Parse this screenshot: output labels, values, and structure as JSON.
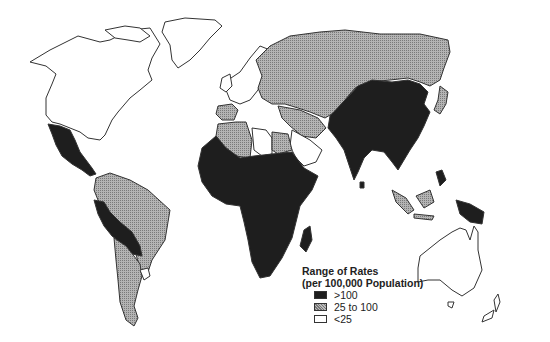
{
  "map": {
    "type": "choropleth world map",
    "colors": {
      "high": "#1e1e1e",
      "mid": "#a6a6a6",
      "low": "#ffffff",
      "outline": "#333333"
    }
  },
  "legend": {
    "title_line1": "Range of Rates",
    "title_line2": "(per 100,000 Population)",
    "items": [
      {
        "label": ">100",
        "class": "high"
      },
      {
        "label": "25 to 100",
        "class": "mid"
      },
      {
        "label": "<25",
        "class": "low"
      }
    ]
  },
  "regions": {
    "high": [
      "Mexico",
      "Central America",
      "Peru",
      "Bolivia",
      "Sub-Saharan Africa",
      "Madagascar",
      "China",
      "India",
      "Southeast Asia",
      "Papua New Guinea"
    ],
    "mid": [
      "Russia",
      "Eastern Europe",
      "Central Asia",
      "Middle East",
      "North Africa (Algeria, Egypt)",
      "Brazil",
      "Argentina",
      "Chile",
      "Indonesia",
      "Japan"
    ],
    "low": [
      "North America",
      "Greenland",
      "Western Europe",
      "Libya",
      "Saudi Arabia",
      "Uruguay",
      "Australia",
      "New Zealand"
    ]
  }
}
